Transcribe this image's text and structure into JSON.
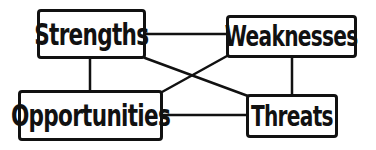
{
  "diagram": {
    "type": "SWOT relationship diagram",
    "colors": {
      "stroke": "#111111",
      "background": "#ffffff",
      "text": "#111111"
    },
    "nodes": [
      {
        "id": "strengths",
        "label": "Strengths",
        "x": 37,
        "y": 9,
        "w": 109,
        "h": 50,
        "font": 30
      },
      {
        "id": "weaknesses",
        "label": "Weaknesses",
        "x": 226,
        "y": 15,
        "w": 131,
        "h": 43,
        "font": 28
      },
      {
        "id": "opportunities",
        "label": "Opportunities",
        "x": 18,
        "y": 90,
        "w": 145,
        "h": 51,
        "font": 30
      },
      {
        "id": "threats",
        "label": "Threats",
        "x": 246,
        "y": 94,
        "w": 92,
        "h": 44,
        "font": 28
      }
    ],
    "edges": [
      {
        "from": "strengths",
        "to": "weaknesses",
        "x1": 146,
        "y1": 34,
        "x2": 226,
        "y2": 34
      },
      {
        "from": "strengths",
        "to": "opportunities",
        "x1": 90,
        "y1": 59,
        "x2": 90,
        "y2": 90
      },
      {
        "from": "weaknesses",
        "to": "threats",
        "x1": 292,
        "y1": 58,
        "x2": 292,
        "y2": 94
      },
      {
        "from": "opportunities",
        "to": "threats",
        "x1": 163,
        "y1": 115,
        "x2": 246,
        "y2": 115
      },
      {
        "from": "strengths",
        "to": "threats",
        "x1": 145,
        "y1": 58,
        "x2": 248,
        "y2": 96
      },
      {
        "from": "weaknesses",
        "to": "opportunities",
        "x1": 227,
        "y1": 56,
        "x2": 162,
        "y2": 92
      }
    ]
  }
}
